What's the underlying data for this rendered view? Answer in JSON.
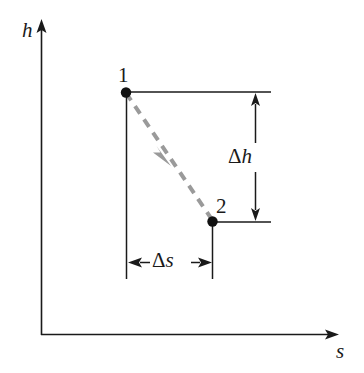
{
  "figure": {
    "type": "thermodynamic-h-s-diagram",
    "background_color": "#ffffff",
    "line_color": "#1a1a1a",
    "process_color": "#999999"
  },
  "axes": {
    "y": {
      "label": "h",
      "name": "enthalpy-axis",
      "arrow": "up"
    },
    "x": {
      "label": "s",
      "name": "entropy-axis",
      "arrow": "right"
    }
  },
  "points": [
    {
      "label": "1",
      "name": "state-point-1"
    },
    {
      "label": "2",
      "name": "state-point-2"
    }
  ],
  "process": {
    "style": "dashed",
    "color": "#999999",
    "direction": "from-1-to-2"
  },
  "dimensions": [
    {
      "name": "delta-h",
      "delta": "Δ",
      "symbol": "h",
      "orientation": "vertical"
    },
    {
      "name": "delta-s",
      "delta": "Δ",
      "symbol": "s",
      "orientation": "horizontal"
    }
  ]
}
